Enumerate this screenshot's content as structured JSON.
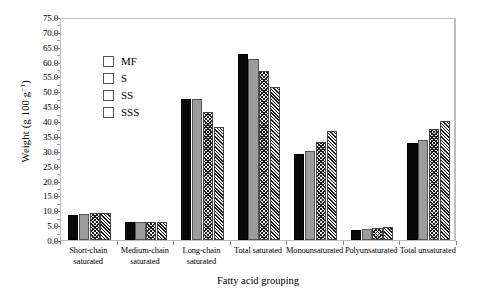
{
  "chart_data": {
    "type": "bar",
    "title": "",
    "xlabel": "Fatty acid grouping",
    "ylabel": "Weight (g 100 g⁻¹)",
    "ylabel_main": "Weight (g 100 g",
    "ylabel_exp": "−1",
    "ylabel_tail": ")",
    "ylim": [
      0.0,
      75.0
    ],
    "ytick_step": 5.0,
    "yticks": [
      "0.0",
      "5.0",
      "10.0",
      "15.0",
      "20.0",
      "25.0",
      "30.0",
      "35.0",
      "40.0",
      "45.0",
      "50.0",
      "55.0",
      "60.0",
      "65.0",
      "70.0",
      "75.0"
    ],
    "grid": false,
    "legend_position": "upper-left-inside",
    "categories": [
      "Short-chain saturated",
      "Medium-chain saturated",
      "Long-chain saturated",
      "Total saturated",
      "Monounsaturated",
      "Polyunsaturated",
      "Total unsaturated"
    ],
    "category_lines": [
      [
        "Short-chain",
        "saturated"
      ],
      [
        "Medium-chain",
        "saturated"
      ],
      [
        "Long-chain",
        "saturated"
      ],
      [
        "Total saturated"
      ],
      [
        "Monounsaturated"
      ],
      [
        "Polyunsaturated"
      ],
      [
        "Total unsaturated"
      ]
    ],
    "series": [
      {
        "name": "MF",
        "fill": "solid-black",
        "color": "#080808",
        "values": [
          8.5,
          6.0,
          47.5,
          62.5,
          29.0,
          3.5,
          32.5
        ]
      },
      {
        "name": "S",
        "fill": "solid-gray",
        "color": "#9c9c9c",
        "values": [
          8.7,
          6.2,
          47.5,
          61.0,
          30.0,
          3.7,
          33.5
        ]
      },
      {
        "name": "SS",
        "fill": "crosshatch",
        "color": "#efefef",
        "values": [
          9.0,
          6.0,
          43.0,
          57.0,
          33.0,
          4.2,
          37.5
        ]
      },
      {
        "name": "SSS",
        "fill": "diagonal",
        "color": "#f2f2f2",
        "values": [
          9.0,
          6.0,
          38.0,
          51.5,
          36.5,
          4.5,
          40.0
        ]
      }
    ]
  },
  "legend": {
    "items": [
      {
        "label": "MF"
      },
      {
        "label": "S"
      },
      {
        "label": "SS"
      },
      {
        "label": "SSS"
      }
    ]
  }
}
